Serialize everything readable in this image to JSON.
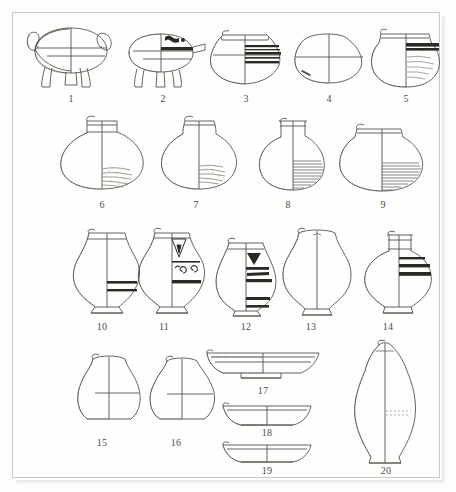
{
  "plate": {
    "title": "Archaeological pottery typology plate",
    "background_color": "#fdfdfc",
    "frame_color": "#c9c9c6",
    "ink_color": "#55544f",
    "paint_color": "#2a2926",
    "figure_count": 20,
    "rows": [
      {
        "row": 1,
        "figures": [
          "1",
          "2",
          "3",
          "4",
          "5"
        ]
      },
      {
        "row": 2,
        "figures": [
          "6",
          "7",
          "8",
          "9"
        ]
      },
      {
        "row": 3,
        "figures": [
          "10",
          "11",
          "12",
          "13",
          "14"
        ]
      },
      {
        "row": 4,
        "figures": [
          "15",
          "16",
          "17",
          "18",
          "19",
          "20"
        ]
      }
    ]
  },
  "figures": [
    {
      "id": "1",
      "label": "1",
      "type": "tripod-cauldron",
      "notes": "wide ovoid body, three legs, two lug handles, hatched section at left"
    },
    {
      "id": "2",
      "label": "2",
      "type": "tripod-spouted-jar",
      "notes": "ovoid body with spout, four short legs, dark painted shoulder band"
    },
    {
      "id": "3",
      "label": "3",
      "type": "wide-mouth-jar",
      "notes": "carinated body, multiple dark horizontal bands on shoulder"
    },
    {
      "id": "4",
      "label": "4",
      "type": "plain-bowl-jar",
      "notes": "plain carinated vessel, no painted decoration"
    },
    {
      "id": "5",
      "label": "5",
      "type": "globular-jar",
      "notes": "dark shoulder band over striated lower body"
    },
    {
      "id": "6",
      "label": "6",
      "type": "wide-shoulder-jar",
      "notes": "short neck, broad shoulder, stippled lower body"
    },
    {
      "id": "7",
      "label": "7",
      "type": "globular-neck-jar",
      "notes": "flaring neck, stippled lower body"
    },
    {
      "id": "8",
      "label": "8",
      "type": "narrow-neck-jar",
      "notes": "tall neck, densely hatched lower half"
    },
    {
      "id": "9",
      "label": "9",
      "type": "squat-wide-jar",
      "notes": "low squat body, hatched lower half"
    },
    {
      "id": "10",
      "label": "10",
      "type": "footed-pear-jar",
      "notes": "footed base, two dark bands at mid body"
    },
    {
      "id": "11",
      "label": "11",
      "type": "painted-spiral-jar",
      "notes": "triangular neck motif, spiral scrolls on body, dark band"
    },
    {
      "id": "12",
      "label": "12",
      "type": "chevron-band-jar",
      "notes": "chevron motif on neck, several thick dark bands"
    },
    {
      "id": "13",
      "label": "13",
      "type": "plain-footed-jar",
      "notes": "plain waisted profile, no painted decoration"
    },
    {
      "id": "14",
      "label": "14",
      "type": "banded-shoulder-jar",
      "notes": "tall collar neck, three dark bands on shoulder"
    },
    {
      "id": "15",
      "label": "15",
      "type": "plain-globular-pot",
      "notes": "plain short-necked pot, hatched section edge"
    },
    {
      "id": "16",
      "label": "16",
      "type": "plain-globular-pot",
      "notes": "plain short-necked pot, slightly wider body"
    },
    {
      "id": "17",
      "label": "17",
      "type": "shallow-basin",
      "notes": "wide shallow basin with ring foot, profile section"
    },
    {
      "id": "18",
      "label": "18",
      "type": "shallow-bowl",
      "notes": "shallow open bowl, profile section"
    },
    {
      "id": "19",
      "label": "19",
      "type": "shallow-bowl",
      "notes": "shallow open bowl, flat base, profile section"
    },
    {
      "id": "20",
      "label": "20",
      "type": "tall-amphora",
      "notes": "tall elongated amphora with narrow tapering neck"
    }
  ]
}
